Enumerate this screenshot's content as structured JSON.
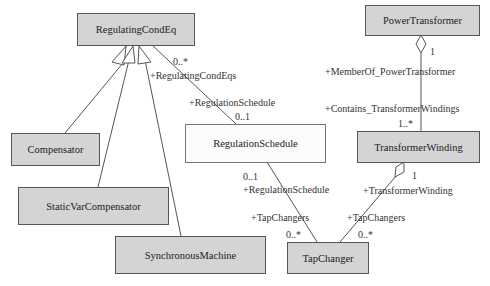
{
  "diagram": {
    "type": "UML class diagram",
    "classes": [
      {
        "id": "regulatingcondeq",
        "name": "RegulatingCondEq"
      },
      {
        "id": "powertransformer",
        "name": "PowerTransformer"
      },
      {
        "id": "regulationschedule",
        "name": "RegulationSchedule"
      },
      {
        "id": "transformerwinding",
        "name": "TransformerWinding"
      },
      {
        "id": "compensator",
        "name": "Compensator"
      },
      {
        "id": "staticvarcompensator",
        "name": "StaticVarCompensator"
      },
      {
        "id": "synchronousmachine",
        "name": "SynchronousMachine"
      },
      {
        "id": "tapchanger",
        "name": "TapChanger"
      }
    ],
    "generalizations": [
      {
        "child": "Compensator",
        "parent": "RegulatingCondEq"
      },
      {
        "child": "StaticVarCompensator",
        "parent": "RegulatingCondEq"
      },
      {
        "child": "SynchronousMachine",
        "parent": "RegulatingCondEq"
      }
    ],
    "associations": [
      {
        "from": "RegulatingCondEq",
        "to": "RegulationSchedule",
        "from_role": "+RegulatingCondEqs",
        "from_mult": "0..*",
        "to_role": "+RegulationSchedule",
        "to_mult": "0..1"
      },
      {
        "from": "RegulationSchedule",
        "to": "TapChanger",
        "from_role": "+RegulationSchedule",
        "from_mult": "0..1",
        "to_role": "+TapChangers",
        "to_mult": "0..*"
      },
      {
        "from": "PowerTransformer",
        "to": "TransformerWinding",
        "kind": "aggregation",
        "from_role": "+MemberOf_PowerTransformer",
        "from_mult": "1",
        "to_role": "+Contains_TransformerWindings",
        "to_mult": "1..*"
      },
      {
        "from": "TransformerWinding",
        "to": "TapChanger",
        "kind": "aggregation",
        "from_role": "+TransformerWinding",
        "from_mult": "1",
        "to_role": "+TapChangers",
        "to_mult": "0..*"
      }
    ]
  },
  "labels": {
    "rce_mult": "0..*",
    "rce_role": "+RegulatingCondEqs",
    "rs_top_role": "+RegulationSchedule",
    "rs_top_mult": "0..1",
    "rs_bottom_mult": "0..1",
    "rs_bottom_role": "+RegulationSchedule",
    "tc_left_role": "+TapChangers",
    "tc_left_mult": "0..*",
    "pt_mult": "1",
    "pt_role": "+MemberOf_PowerTransformer",
    "tw_top_role": "+Contains_TransformerWindings",
    "tw_top_mult": "1..*",
    "tw_bottom_mult": "1",
    "tw_bottom_role": "+TransformerWinding",
    "tc_right_role": "+TapChangers",
    "tc_right_mult": "0..*"
  },
  "colors": {
    "class_fill": "#d4d4d4",
    "schedule_fill": "#fbfbfb",
    "line": "#555555"
  }
}
